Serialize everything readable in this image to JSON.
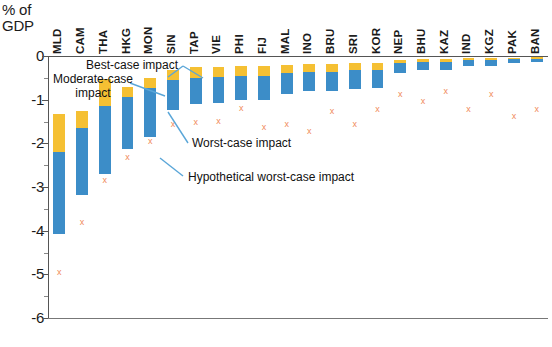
{
  "chart_data": {
    "type": "bar",
    "title": "",
    "subtitle": "",
    "ylabel": "% of GDP",
    "xlabel": "",
    "ylim": [
      -6,
      0
    ],
    "yticks": [
      0,
      -1,
      -2,
      -3,
      -4,
      -5,
      -6
    ],
    "ytick_labels": [
      "0",
      "-1",
      "-2",
      "-3",
      "-4",
      "-5",
      "-6"
    ],
    "grid": false,
    "legend_position": "annotations",
    "stacked": true,
    "categories": [
      "MLD",
      "CAM",
      "THA",
      "HKG",
      "MON",
      "SIN",
      "TAP",
      "VIE",
      "PHI",
      "FIJ",
      "MAL",
      "INO",
      "BRU",
      "SRI",
      "KOR",
      "NEP",
      "BHU",
      "KAZ",
      "IND",
      "KGZ",
      "PAK",
      "BAN"
    ],
    "series": [
      {
        "name": "Best-case impact",
        "color": "#f5c033",
        "values": [
          -1.33,
          -1.26,
          -0.52,
          -0.72,
          -0.5,
          -0.33,
          -0.26,
          -0.25,
          -0.22,
          -0.22,
          -0.2,
          -0.18,
          -0.18,
          -0.17,
          -0.17,
          -0.09,
          -0.07,
          -0.07,
          -0.05,
          -0.05,
          -0.04,
          -0.03
        ]
      },
      {
        "name": "Moderate-case impact",
        "color": "#3c8dc8",
        "values": [
          -2.19,
          -1.64,
          -1.14,
          -0.95,
          -0.74,
          -0.55,
          -0.5,
          -0.48,
          -0.45,
          -0.45,
          -0.38,
          -0.36,
          -0.36,
          -0.33,
          -0.33,
          -0.17,
          -0.14,
          -0.14,
          -0.1,
          -0.1,
          -0.07,
          -0.06
        ]
      },
      {
        "name": "Worst-case impact",
        "color": "#3c8dc8",
        "values": [
          -4.07,
          -3.19,
          -2.71,
          -2.12,
          -1.86,
          -1.24,
          -1.1,
          -1.07,
          -1.0,
          -1.0,
          -0.86,
          -0.81,
          -0.81,
          -0.76,
          -0.74,
          -0.4,
          -0.31,
          -0.31,
          -0.24,
          -0.22,
          -0.17,
          -0.14
        ]
      }
    ],
    "markers": {
      "name": "Hypothetical worst-case impact",
      "symbol": "x",
      "color": "#f08a5a",
      "values": [
        -4.95,
        -3.8,
        -2.83,
        -2.31,
        -1.95,
        -1.55,
        -1.52,
        -1.48,
        -1.2,
        -1.62,
        -1.55,
        -1.72,
        -1.26,
        -1.55,
        -1.22,
        -0.88,
        -1.02,
        -0.8,
        -1.22,
        -0.86,
        -1.38,
        -1.22
      ]
    },
    "annotations": [
      {
        "id": "best-case",
        "text": "Best-case impact"
      },
      {
        "id": "moderate-case",
        "text": "Moderate-case impact"
      },
      {
        "id": "worst-case",
        "text": "Worst-case impact"
      },
      {
        "id": "hypothetical-worst-case",
        "text": "Hypothetical worst-case impact"
      }
    ]
  }
}
